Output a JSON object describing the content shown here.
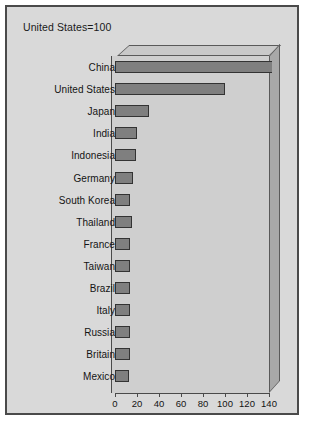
{
  "chart_data": {
    "type": "bar",
    "orientation": "horizontal",
    "title": "United States=100",
    "xlabel": "",
    "ylabel": "",
    "xlim": [
      0,
      140
    ],
    "grid": false,
    "legend": false,
    "categories": [
      "China",
      "United States",
      "Japan",
      "India",
      "Indonesia",
      "Germany",
      "South Korea",
      "Thailand",
      "France",
      "Taiwan",
      "Brazil",
      "Italy",
      "Russia",
      "Britain",
      "Mexico"
    ],
    "values": [
      143,
      100,
      31,
      20,
      19,
      16,
      14,
      15,
      14,
      14,
      14,
      14,
      14,
      14,
      13
    ],
    "ticks": [
      0,
      20,
      40,
      60,
      80,
      100,
      120,
      140
    ],
    "colors": {
      "bar_fill": "#7f7f7f",
      "bar_border": "#333333",
      "panel": "#d9d9d9",
      "plot_face": "#cfcfcf",
      "plot_wall": "#a8a8a8",
      "plot_top": "#c9c9c9",
      "frame_border": "#4a4a4a",
      "text": "#141414"
    }
  }
}
